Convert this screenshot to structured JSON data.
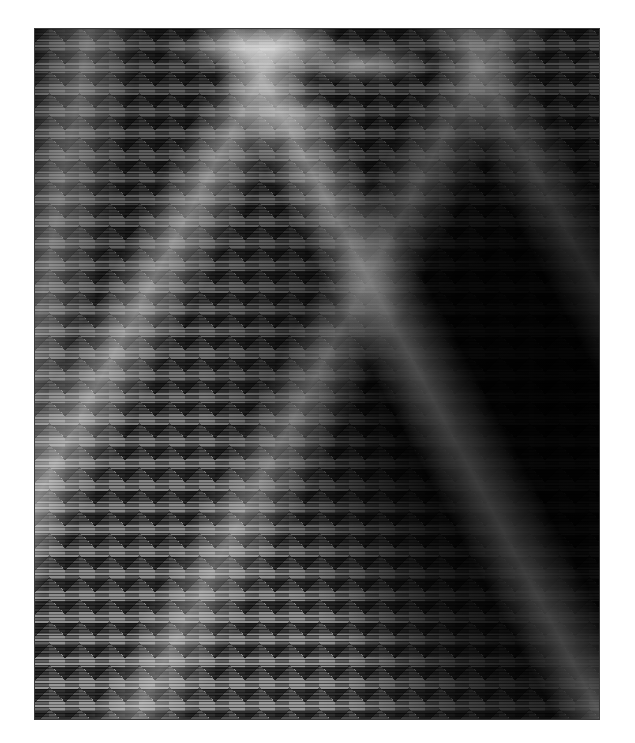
{
  "image": {
    "description": "Grayscale woven zigzag texture in a thin dark frame",
    "frame": {
      "x": 34,
      "y": 28,
      "width": 566,
      "height": 692,
      "border_color": "#3a3a3a"
    },
    "background_color": "#ffffff",
    "palette": {
      "light_gray": "#c8c8c8",
      "mid_gray": "#8a8a8a",
      "dark_gray": "#1a1a1a",
      "near_black": "#0a0a0a"
    },
    "regions": [
      {
        "name": "upper-band",
        "tone": "mid gray with dark chevron teeth and light streaks at top center"
      },
      {
        "name": "right-center",
        "tone": "near black"
      },
      {
        "name": "lower-left",
        "tone": "light gray with zigzag bands"
      },
      {
        "name": "bottom-right",
        "tone": "dark gray"
      }
    ]
  }
}
